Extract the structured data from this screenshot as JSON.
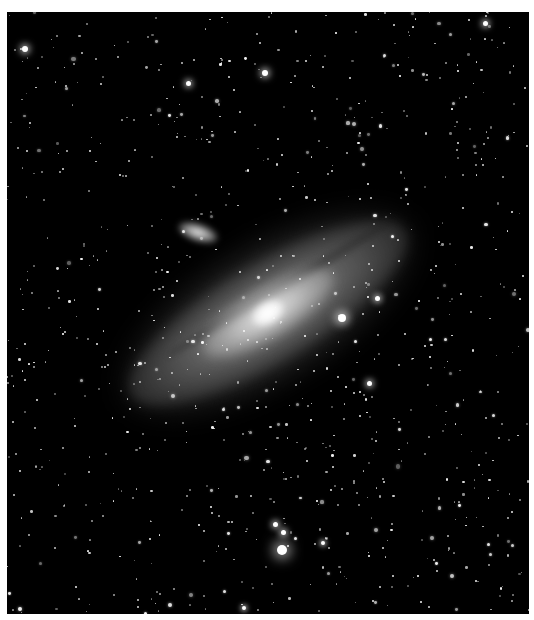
{
  "image": {
    "subject": "spiral galaxy with satellite galaxy and star field",
    "frame": {
      "x": 7,
      "y": 12,
      "width": 522,
      "height": 602,
      "border_color": "#ffffff",
      "sky_color": "#000000"
    }
  },
  "galaxy": {
    "center": [
      261,
      301
    ],
    "length": 330,
    "width": 120,
    "angle_deg": -31,
    "core_color": "#ffffff",
    "disk_color": "#9a9a9a"
  },
  "satellite_galaxy": {
    "center": [
      191,
      220
    ],
    "length": 40,
    "width": 17,
    "angle_deg": 18
  },
  "bright_stars": [
    {
      "x": 335,
      "y": 306,
      "r": 4
    },
    {
      "x": 275,
      "y": 538,
      "r": 5
    },
    {
      "x": 268,
      "y": 512,
      "r": 2.5
    },
    {
      "x": 276,
      "y": 520,
      "r": 2.5
    },
    {
      "x": 258,
      "y": 61,
      "r": 3
    },
    {
      "x": 18,
      "y": 37,
      "r": 3
    },
    {
      "x": 478,
      "y": 11,
      "r": 2.5
    },
    {
      "x": 370,
      "y": 286,
      "r": 2.5
    },
    {
      "x": 362,
      "y": 371,
      "r": 2.5
    },
    {
      "x": 181,
      "y": 71,
      "r": 2.5
    },
    {
      "x": 316,
      "y": 531,
      "r": 2
    },
    {
      "x": 237,
      "y": 596,
      "r": 2
    }
  ],
  "star_field": {
    "count": 900,
    "seed": 7
  }
}
